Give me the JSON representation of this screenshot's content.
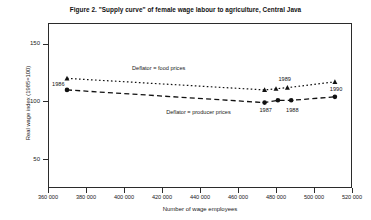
{
  "figure": {
    "title": "Figure 2. \"Supply curve\" of female wage labour to agriculture, Central Java"
  },
  "chart_data": {
    "type": "scatter",
    "title": "Figure 2. \"Supply curve\" of female wage labour to agriculture, Central Java",
    "xlabel": "Number of wage employees",
    "ylabel": "Real wage index (1985=100)",
    "xlim": [
      360000,
      520000
    ],
    "ylim": [
      25,
      168
    ],
    "xticks": [
      360000,
      380000,
      400000,
      420000,
      440000,
      460000,
      480000,
      500000,
      520000
    ],
    "xticklabels": [
      "360 000",
      "380 000",
      "400 000",
      "420 000",
      "440 000",
      "460 000",
      "480 000",
      "500 000",
      "520 000"
    ],
    "yticks": [
      50,
      100,
      150
    ],
    "yticklabels": [
      "50",
      "100",
      "150"
    ],
    "grid": false,
    "legend_position": "inline-annotation",
    "annotations": [
      {
        "text": "Deflator = food prices",
        "x": 420000,
        "y": 128
      },
      {
        "text": "Deflator = producer prices",
        "x": 438000,
        "y": 90
      }
    ],
    "series": [
      {
        "name": "Deflator = food prices",
        "marker": "triangle",
        "linestyle": "dotted",
        "color": "#111111",
        "points": [
          {
            "x": 370000,
            "y": 120,
            "label": "1986"
          },
          {
            "x": 474000,
            "y": 110,
            "label": "1987"
          },
          {
            "x": 480000,
            "y": 111,
            "label": "1988"
          },
          {
            "x": 486000,
            "y": 112,
            "label": "1989"
          },
          {
            "x": 511000,
            "y": 117,
            "label": "1990"
          }
        ]
      },
      {
        "name": "Deflator = producer prices",
        "marker": "circle",
        "linestyle": "dashed",
        "color": "#111111",
        "points": [
          {
            "x": 370000,
            "y": 110,
            "label": "1986"
          },
          {
            "x": 474000,
            "y": 99,
            "label": "1987"
          },
          {
            "x": 481000,
            "y": 101,
            "label": "1988"
          },
          {
            "x": 488000,
            "y": 101,
            "label": "1989"
          },
          {
            "x": 511000,
            "y": 104,
            "label": "1990"
          }
        ]
      }
    ],
    "point_labels": [
      {
        "text": "1986",
        "x": 369000,
        "y": 114,
        "anchor": "end"
      },
      {
        "text": "1987",
        "x": 475000,
        "y": 92,
        "anchor": "middle"
      },
      {
        "text": "1988",
        "x": 489000,
        "y": 92,
        "anchor": "middle"
      },
      {
        "text": "1989",
        "x": 485000,
        "y": 119,
        "anchor": "middle"
      },
      {
        "text": "1990",
        "x": 512000,
        "y": 110,
        "anchor": "middle"
      }
    ]
  }
}
